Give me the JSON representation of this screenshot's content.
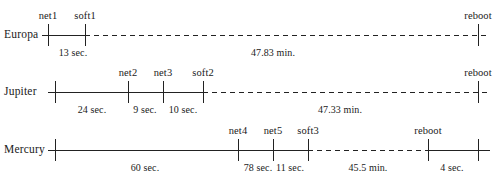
{
  "diagram": {
    "rows": [
      {
        "name": "Europa",
        "label": "Europa",
        "baseline_y": 35,
        "axis_start_x": 42,
        "axis_end_x": 490,
        "label_x": 4,
        "ticks": [
          {
            "x": 48,
            "event": "net1"
          },
          {
            "x": 85,
            "event": "soft1"
          },
          {
            "x": 478,
            "event": "reboot"
          }
        ],
        "segments": [
          {
            "from_x": 42,
            "to_x": 85,
            "style": "solid"
          },
          {
            "from_x": 85,
            "to_x": 490,
            "style": "dashed"
          }
        ],
        "durations": [
          {
            "center_x": 73,
            "label": "13 sec."
          },
          {
            "center_x": 273,
            "label": "47.83 min."
          }
        ]
      },
      {
        "name": "Jupiter",
        "label": "Jupiter",
        "baseline_y": 92,
        "axis_start_x": 48,
        "axis_end_x": 490,
        "label_x": 4,
        "ticks": [
          {
            "x": 55,
            "event": ""
          },
          {
            "x": 128,
            "event": "net2"
          },
          {
            "x": 163,
            "event": "net3"
          },
          {
            "x": 203,
            "event": "soft2"
          },
          {
            "x": 478,
            "event": "reboot"
          }
        ],
        "segments": [
          {
            "from_x": 48,
            "to_x": 203,
            "style": "solid"
          },
          {
            "from_x": 203,
            "to_x": 490,
            "style": "dashed"
          }
        ],
        "durations": [
          {
            "center_x": 92,
            "label": "24 sec."
          },
          {
            "center_x": 145,
            "label": "9 sec."
          },
          {
            "center_x": 183,
            "label": "10 sec."
          },
          {
            "center_x": 340,
            "label": "47.33 min."
          }
        ]
      },
      {
        "name": "Mercury",
        "label": "Mercury",
        "baseline_y": 150,
        "axis_start_x": 48,
        "axis_end_x": 490,
        "label_x": 4,
        "ticks": [
          {
            "x": 55,
            "event": ""
          },
          {
            "x": 238,
            "event": "net4"
          },
          {
            "x": 273,
            "event": "net5"
          },
          {
            "x": 308,
            "event": "soft3"
          },
          {
            "x": 428,
            "event": "reboot"
          },
          {
            "x": 478,
            "event": ""
          }
        ],
        "segments": [
          {
            "from_x": 48,
            "to_x": 308,
            "style": "solid"
          },
          {
            "from_x": 308,
            "to_x": 428,
            "style": "dashed"
          },
          {
            "from_x": 428,
            "to_x": 490,
            "style": "solid"
          }
        ],
        "durations": [
          {
            "center_x": 145,
            "label": "60 sec."
          },
          {
            "center_x": 258,
            "label": "78 sec."
          },
          {
            "center_x": 290,
            "label": "11 sec."
          },
          {
            "center_x": 368,
            "label": "45.5 min."
          },
          {
            "center_x": 452,
            "label": "4 sec."
          }
        ]
      }
    ]
  }
}
